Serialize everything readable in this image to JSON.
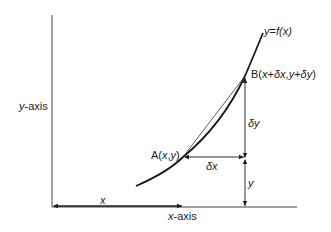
{
  "diagram": {
    "curve_label": {
      "lhs": "y",
      "eq": "=",
      "rhs_f": "f",
      "rhs_arg": "(x)"
    },
    "point_a": {
      "name": "A",
      "open": "(",
      "x": "x",
      "comma": ",",
      "y": "y",
      "close": ")"
    },
    "point_b": {
      "name": "B",
      "open": "(",
      "x": "x",
      "plus1": "+",
      "dx": "δx",
      "comma": ",",
      "y": "y",
      "plus2": "+",
      "dy": "δy",
      "close": ")"
    },
    "y_axis_label": {
      "var": "y",
      "suffix": "-axis"
    },
    "x_axis_label": {
      "var": "x",
      "suffix": "-axis"
    },
    "dx_label": "δx",
    "dy_label": "δy",
    "y_label": "y",
    "x_label": "x",
    "colors": {
      "line": "#1a1a1a",
      "background": "#ffffff"
    }
  }
}
